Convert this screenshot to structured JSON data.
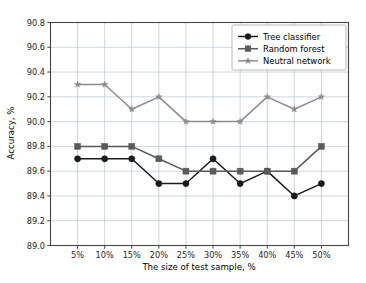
{
  "chart_data": {
    "type": "line",
    "title": "",
    "xlabel": "The size of test sample, %",
    "ylabel": "Accuracy, %",
    "categories": [
      "5%",
      "10%",
      "15%",
      "20%",
      "25%",
      "30%",
      "35%",
      "40%",
      "45%",
      "50%"
    ],
    "x_tick_labels": [
      "5%",
      "10%",
      "15%",
      "20%",
      "25%",
      "30%",
      "35%",
      "40%",
      "45%",
      "50%"
    ],
    "y_tick_labels": [
      "89.0",
      "89.2",
      "89.4",
      "89.6",
      "89.8",
      "90.0",
      "90.2",
      "90.4",
      "90.6",
      "90.8"
    ],
    "y_ticks": [
      89.0,
      89.2,
      89.4,
      89.6,
      89.8,
      90.0,
      90.2,
      90.4,
      90.6,
      90.8
    ],
    "ylim": [
      89.0,
      90.8
    ],
    "xlim": [
      0,
      11
    ],
    "grid": true,
    "legend_position": "top-right",
    "series": [
      {
        "name": "Tree classifier",
        "marker": "circle",
        "color": "#1a1a1a",
        "values": [
          89.7,
          89.7,
          89.7,
          89.5,
          89.5,
          89.7,
          89.5,
          89.6,
          89.4,
          89.5
        ]
      },
      {
        "name": "Random forest",
        "marker": "square",
        "color": "#5a5a5a",
        "values": [
          89.8,
          89.8,
          89.8,
          89.7,
          89.6,
          89.6,
          89.6,
          89.6,
          89.6,
          89.8
        ]
      },
      {
        "name": "Neutral network",
        "marker": "star",
        "color": "#8c8c8c",
        "values": [
          90.3,
          90.3,
          90.1,
          90.2,
          90.0,
          90.0,
          90.0,
          90.2,
          90.1,
          90.2
        ]
      }
    ]
  },
  "style": {
    "grid_color": "#b8c4d0",
    "axis_color": "#444444",
    "legend_border_color": "#b0b0b0",
    "background": "#ffffff"
  }
}
